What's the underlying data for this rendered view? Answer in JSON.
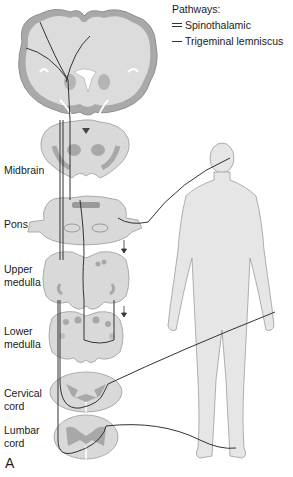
{
  "legend": {
    "title": "Pathways:",
    "items": [
      {
        "label": "Spinothalamic",
        "style": "double-line"
      },
      {
        "label": "Trigeminal lemniscus",
        "style": "single-line"
      }
    ]
  },
  "levels": [
    {
      "id": "midbrain",
      "line1": "Midbrain",
      "line2": ""
    },
    {
      "id": "pons",
      "line1": "Pons",
      "line2": ""
    },
    {
      "id": "upper-medulla",
      "line1": "Upper",
      "line2": "medulla"
    },
    {
      "id": "lower-medulla",
      "line1": "Lower",
      "line2": "medulla"
    },
    {
      "id": "cervical-cord",
      "line1": "Cervical",
      "line2": "cord"
    },
    {
      "id": "lumbar-cord",
      "line1": "Lumbar",
      "line2": "cord"
    }
  ],
  "panel_letter": "A",
  "colors": {
    "tissue": "#d9d9d9",
    "tissue_edge": "#9a9a9a",
    "gray_matter": "#a8a8a8",
    "pathway": "#333333",
    "body": "#e6e6e6",
    "body_edge": "#9c9c9c"
  }
}
